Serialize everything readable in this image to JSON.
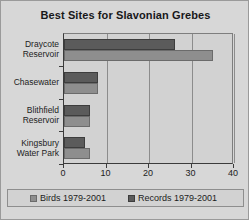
{
  "chart_data": {
    "type": "bar",
    "orientation": "horizontal",
    "title": "Best Sites for Slavonian Grebes",
    "xlabel": "",
    "ylabel": "",
    "categories": [
      "Draycote Reservoir",
      "Chasewater",
      "Blithfield Reservoir",
      "Kingsbury Water Park"
    ],
    "category_lines": [
      [
        "Draycote",
        "Reservoir"
      ],
      [
        "Chasewater",
        ""
      ],
      [
        "Blithfield",
        "Reservoir"
      ],
      [
        "Kingsbury",
        "Water Park"
      ]
    ],
    "series": [
      {
        "name": "Records 1979-2001",
        "color": "#5b5b5b",
        "values": [
          26,
          8,
          6,
          5
        ]
      },
      {
        "name": "Birds 1979-2001",
        "color": "#8e8e8e",
        "values": [
          35,
          8,
          6,
          6
        ]
      }
    ],
    "xlim": [
      0,
      40
    ],
    "xticks": [
      0,
      10,
      20,
      30,
      40
    ],
    "xtick_labels": [
      "0",
      "10",
      "20",
      "30",
      "40"
    ],
    "grid": true,
    "grid_axis": "x",
    "legend_position": "bottom",
    "legend": [
      "Birds 1979-2001",
      "Records 1979-2001"
    ]
  },
  "colors": {
    "background": "#d7d7d7",
    "plot_background": "#d2d2d2",
    "axis": "#3b3b3b",
    "grid": "#8c8c8c",
    "text": "#1c1c1c",
    "records": "#5b5b5b",
    "birds": "#8e8e8e"
  }
}
